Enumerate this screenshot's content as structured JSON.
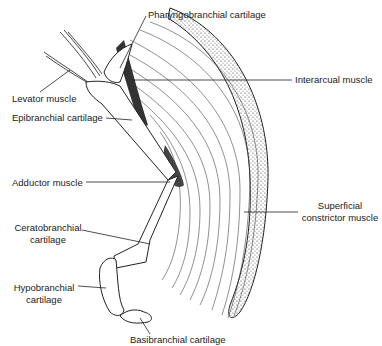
{
  "diagram": {
    "type": "anatomical illustration",
    "labels": {
      "pharyngobranchial": "Pharyngobranchial cartilage",
      "levator": "Levator muscle",
      "epibranchial": "Epibranchial cartilage",
      "interarcual": "Interarcual muscle",
      "adductor": "Adductor muscle",
      "ceratobranchial_1": "Ceratobranchial",
      "ceratobranchial_2": "cartilage",
      "superficial_1": "Superficial",
      "superficial_2": "constrictor muscle",
      "hypobranchial_1": "Hypobranchial",
      "hypobranchial_2": "cartilage",
      "basibranchial": "Basibranchial cartilage"
    }
  }
}
